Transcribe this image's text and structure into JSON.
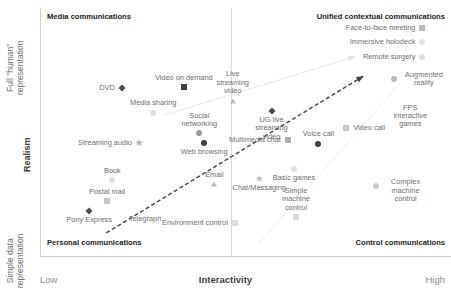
{
  "axes": {
    "x_title": "Interactivity",
    "x_low": "Low",
    "x_high": "High",
    "y_title": "Realism",
    "y_top": "Full \"human\"\nrepresentation",
    "y_bottom": "Simple data\nrepresentation"
  },
  "quadrants": {
    "top_left": "Media communications",
    "top_right": "Unified contextual communications",
    "bottom_left": "Personal communications",
    "bottom_right": "Control communications"
  },
  "chart_data": {
    "type": "scatter",
    "title": "",
    "xlabel": "Interactivity",
    "ylabel": "Realism",
    "xlim": [
      0,
      100
    ],
    "ylim": [
      0,
      100
    ],
    "xtick_labels": [
      "Low",
      "High"
    ],
    "ytick_labels": [
      "Simple data representation",
      "Full \"human\" representation"
    ],
    "grid": false,
    "legend": "none",
    "quadrant_labels": [
      "Media communications",
      "Unified contextual communications",
      "Personal communications",
      "Control communications"
    ],
    "annotations": [
      {
        "name": "main-trend-arrow",
        "from": [
          16,
          9
        ],
        "to": [
          79,
          73
        ],
        "style": "dashed",
        "color": "#3f3f41"
      },
      {
        "name": "upper-ray",
        "from": [
          30,
          57
        ],
        "to": [
          77,
          81
        ],
        "style": "solid",
        "color": "#e3e3e3"
      },
      {
        "name": "lower-ray",
        "from": [
          53,
          4
        ],
        "to": [
          88,
          70
        ],
        "style": "solid",
        "color": "#eaeaea"
      }
    ],
    "points": [
      {
        "label": "DVD",
        "x": 19.8,
        "y": 68.2,
        "marker": "diamond",
        "color": "#4a4a4c",
        "label_pos": "left"
      },
      {
        "label": "Video on demand",
        "x": 35.0,
        "y": 68.6,
        "marker": "square",
        "color": "#3f3f41",
        "label_pos": "top"
      },
      {
        "label": "Live streaming video",
        "x": 47.0,
        "y": 63.0,
        "marker": "triangle",
        "color": "#b9b9bb",
        "label_pos": "top"
      },
      {
        "label": "Media sharing",
        "x": 27.5,
        "y": 58.0,
        "marker": "circle",
        "color": "#e0e0e0",
        "label_pos": "top"
      },
      {
        "label": "UG live streaming video",
        "x": 56.5,
        "y": 58.8,
        "marker": "diamond",
        "color": "#4a4a4c",
        "label_pos": "bottom"
      },
      {
        "label": "Social networking",
        "x": 38.8,
        "y": 49.6,
        "marker": "circle",
        "color": "#9a9a9c",
        "label_pos": "top"
      },
      {
        "label": "Web browsing",
        "x": 40.0,
        "y": 45.8,
        "marker": "circle",
        "color": "#3f3f41",
        "label_pos": "bottom"
      },
      {
        "label": "Streaming audio",
        "x": 24.0,
        "y": 45.6,
        "marker": "star",
        "color": "#b5b5b7",
        "label_pos": "left"
      },
      {
        "label": "Multimedia chat",
        "x": 60.5,
        "y": 47.0,
        "marker": "square",
        "color": "#aeaeb0",
        "label_pos": "left"
      },
      {
        "label": "Voice call",
        "x": 68.0,
        "y": 45.5,
        "marker": "circle",
        "color": "#3f3f41",
        "label_pos": "top"
      },
      {
        "label": "Video call",
        "x": 74.8,
        "y": 52.0,
        "marker": "square",
        "color": "#c8c8ca",
        "label_pos": "right"
      },
      {
        "label": "Book",
        "x": 17.5,
        "y": 30.5,
        "marker": "circle",
        "color": "#e0e0e0",
        "label_pos": "top"
      },
      {
        "label": "Postal mail",
        "x": 16.2,
        "y": 22.0,
        "marker": "square",
        "color": "#c8c8ca",
        "label_pos": "top"
      },
      {
        "label": "Pony Express",
        "x": 11.8,
        "y": 18.0,
        "marker": "diamond",
        "color": "#4a4a4c",
        "label_pos": "bottom"
      },
      {
        "label": "Telegraph",
        "x": 25.5,
        "y": 14.5,
        "marker": "none",
        "color": "#b9b9bb",
        "label_pos": "center"
      },
      {
        "label": "Email",
        "x": 42.5,
        "y": 29.0,
        "marker": "triangle",
        "color": "#b9b9bb",
        "label_pos": "top"
      },
      {
        "label": "Chat/Messaging",
        "x": 53.5,
        "y": 31.0,
        "marker": "star",
        "color": "#c2c2c4",
        "label_pos": "bottom"
      },
      {
        "label": "Basic games",
        "x": 62.0,
        "y": 35.0,
        "marker": "circle",
        "color": "#e0e0e0",
        "label_pos": "bottom"
      },
      {
        "label": "Environment control",
        "x": 47.5,
        "y": 13.0,
        "marker": "square",
        "color": "#dcdcde",
        "label_pos": "left"
      },
      {
        "label": "Simple machine control",
        "x": 62.5,
        "y": 15.5,
        "marker": "square",
        "color": "#dcdcde",
        "label_pos": "top"
      },
      {
        "label": "Complex machine control",
        "x": 82.0,
        "y": 28.0,
        "marker": "circle",
        "color": "#c8c8ca",
        "label_pos": "right"
      },
      {
        "label": "FPS interactive games",
        "x": 90.5,
        "y": 56.5,
        "marker": "none",
        "color": "#c8c8ca",
        "label_pos": "center"
      },
      {
        "label": "Augmented reality",
        "x": 86.5,
        "y": 72.0,
        "marker": "circle",
        "color": "#b9b9bb",
        "label_pos": "right"
      },
      {
        "label": "Remote surgery",
        "x": 93.5,
        "y": 81.0,
        "marker": "circle",
        "color": "#dcdcde",
        "label_pos": "left"
      },
      {
        "label": "Immersive holodeck",
        "x": 93.5,
        "y": 87.0,
        "marker": "circle",
        "color": "#e4e4e6",
        "label_pos": "left"
      },
      {
        "label": "Face-to-face meeting",
        "x": 93.5,
        "y": 92.5,
        "marker": "square",
        "color": "#b9b9bb",
        "label_pos": "left"
      }
    ]
  }
}
